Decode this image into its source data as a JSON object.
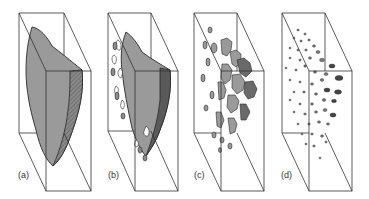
{
  "figure": {
    "panels": [
      {
        "id": "a",
        "label": "(a)",
        "description": "single continuous fracture/crack surface inside block"
      },
      {
        "id": "b",
        "label": "(b)",
        "description": "surface beginning to break up with holes and fragments at edges"
      },
      {
        "id": "c",
        "label": "(c)",
        "description": "surface broken into many separate patches"
      },
      {
        "id": "d",
        "label": "(d)",
        "description": "surface reduced to scattered isolated small inclusions/dots"
      }
    ],
    "colors": {
      "box_stroke": "#333333",
      "fill_gray": "#9a9a9a",
      "fill_dark": "#6a6a6a",
      "outline": "#2a2a2a"
    }
  }
}
